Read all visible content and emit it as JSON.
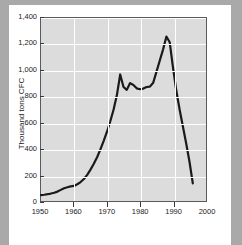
{
  "figure": {
    "background_color": "#ffffff",
    "edge_strip_color": "#a9a9a9",
    "plot_background_color": "#dcdcdc",
    "gridline_color": "#ffffff",
    "frame_color": "#5a5a5a"
  },
  "chart_data": {
    "type": "line",
    "title": "",
    "xlabel": "",
    "ylabel": "Thousand tons CFC",
    "xlim": [
      1950,
      2000
    ],
    "ylim": [
      0,
      1400
    ],
    "xticks": [
      1950,
      1960,
      1970,
      1980,
      1990,
      2000
    ],
    "xtick_labels": [
      "1950",
      "1960",
      "1970",
      "1980",
      "1990",
      "2000"
    ],
    "yticks": [
      0,
      200,
      400,
      600,
      800,
      1000,
      1200,
      1400
    ],
    "ytick_labels": [
      "0",
      "200",
      "400",
      "600",
      "800",
      "1,000",
      "1,200",
      "1,400"
    ],
    "grid": true,
    "legend": false,
    "line_color": "#1a1a1a",
    "line_width": 2.2,
    "series": [
      {
        "name": "CFC production",
        "x": [
          1950,
          1951,
          1952,
          1953,
          1954,
          1955,
          1956,
          1957,
          1958,
          1959,
          1960,
          1961,
          1962,
          1963,
          1964,
          1965,
          1966,
          1967,
          1968,
          1969,
          1970,
          1971,
          1972,
          1973,
          1974,
          1975,
          1976,
          1977,
          1978,
          1979,
          1980,
          1981,
          1982,
          1983,
          1984,
          1985,
          1986,
          1987,
          1988,
          1989,
          1990,
          1991,
          1992,
          1993,
          1994,
          1995,
          1996
        ],
        "values": [
          45,
          48,
          52,
          57,
          63,
          72,
          85,
          98,
          105,
          112,
          115,
          128,
          145,
          168,
          200,
          240,
          285,
          335,
          395,
          460,
          530,
          610,
          700,
          810,
          968,
          872,
          850,
          902,
          888,
          862,
          855,
          860,
          872,
          875,
          905,
          990,
          1075,
          1160,
          1258,
          1215,
          1020,
          845,
          700,
          570,
          440,
          300,
          135
        ]
      }
    ]
  }
}
